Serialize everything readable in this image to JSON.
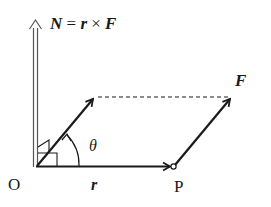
{
  "diagram": {
    "title_equation": {
      "N": "N",
      "eq": " = ",
      "r": "r",
      "times": " × ",
      "F": "F"
    },
    "labels": {
      "origin": "O",
      "point_P": "P",
      "vector_r": "r",
      "vector_F": "F",
      "angle": "θ"
    },
    "colors": {
      "line": "#1a1a1a",
      "torque_arrow": "#555555",
      "background": "#ffffff"
    }
  }
}
